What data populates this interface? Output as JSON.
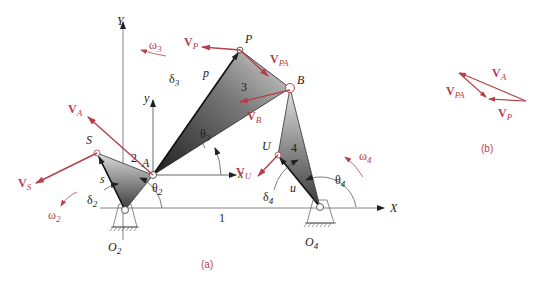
{
  "figure": {
    "part_a": {
      "caption": "(a)",
      "axes": {
        "X": "X",
        "Y": "Y",
        "x": "x",
        "y": "y"
      },
      "points": {
        "O2": "O",
        "O2_sub": "2",
        "O4": "O",
        "O4_sub": "4",
        "A": "A",
        "B": "B",
        "P": "P",
        "S": "S",
        "U": "U"
      },
      "links": {
        "ground": "1",
        "crank": "2",
        "coupler": "3",
        "rocker": "4"
      },
      "lengths": {
        "p": "p",
        "s": "s",
        "u": "u"
      },
      "angles": {
        "theta2": "θ",
        "theta2_sub": "2",
        "theta3": "θ",
        "theta3_sub": "3",
        "theta4": "θ",
        "theta4_sub": "4",
        "delta2": "δ",
        "delta2_sub": "2",
        "delta3": "δ",
        "delta3_sub": "3",
        "delta4": "δ",
        "delta4_sub": "4"
      },
      "angular_velocities": {
        "omega2": "ω",
        "omega2_sub": "2",
        "omega3": "ω",
        "omega3_sub": "3",
        "omega4": "ω",
        "omega4_sub": "4"
      },
      "velocities": {
        "VA": "V",
        "VA_sub": "A",
        "VB": "V",
        "VB_sub": "B",
        "VP": "V",
        "VP_sub": "P",
        "VPA": "V",
        "VPA_sub": "PA",
        "VS": "V",
        "VS_sub": "S",
        "VU": "V",
        "VU_sub": "U"
      }
    },
    "part_b": {
      "caption": "(b)",
      "velocities": {
        "VA": "V",
        "VA_sub": "A",
        "VP": "V",
        "VP_sub": "P",
        "VPA": "V",
        "VPA_sub": "PA"
      }
    },
    "colors": {
      "vector": "#b5404a",
      "line": "#555555",
      "link_dark": "#222222",
      "link_light": "#d8d8d8"
    }
  }
}
